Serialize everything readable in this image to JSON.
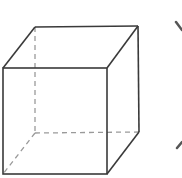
{
  "diagram": {
    "type": "wireframe-cube",
    "background": "#ffffff",
    "stroke_color": "#3a3a3a",
    "hidden_edge_color": "#9a9a9a",
    "front_face": {
      "top_left": [
        3,
        68
      ],
      "top_right": [
        107,
        68
      ],
      "bottom_right": [
        107,
        174
      ],
      "bottom_left": [
        3,
        174
      ]
    },
    "back_face": {
      "top_left": [
        35,
        27
      ],
      "top_right": [
        138,
        26
      ],
      "bottom_right": [
        139,
        132
      ],
      "bottom_left": [
        35,
        133
      ]
    },
    "visible_edges": 9,
    "hidden_edges": 3,
    "side_marks": [
      {
        "name": "upper-mark",
        "from": [
          176,
          22
        ],
        "to": [
          182,
          30
        ]
      },
      {
        "name": "lower-mark",
        "from": [
          177,
          148
        ],
        "to": [
          182,
          142
        ]
      }
    ]
  }
}
